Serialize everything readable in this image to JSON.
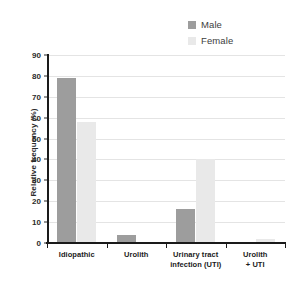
{
  "chart_data": {
    "type": "bar",
    "title": "",
    "subtitle": "",
    "xlabel": "",
    "ylabel": "Relative frequency (%)",
    "categories": [
      "Idiopathic",
      "Urinary tract infection (UTI)",
      "Urolith",
      "Urolith + UTI"
    ],
    "category_lines": [
      [
        "Idiopathic"
      ],
      [
        "Urolith"
      ],
      [
        "Urinary tract",
        "infection (UTI)"
      ],
      [
        "Urolith",
        "+ UTI"
      ]
    ],
    "category_order": [
      "Idiopathic",
      "Urolith",
      "Urinary tract infection (UTI)",
      "Urolith + UTI"
    ],
    "series": [
      {
        "name": "Male",
        "color": "#9d9d9d",
        "values": [
          79,
          16.5,
          4,
          0
        ]
      },
      {
        "name": "Female",
        "color": "#e9e9e9",
        "values": [
          58,
          40,
          0,
          2
        ]
      }
    ],
    "ylim": [
      0,
      90
    ],
    "yticks": [
      0,
      10,
      20,
      30,
      40,
      50,
      60,
      70,
      80,
      90
    ],
    "ytick_labels": [
      "0",
      "10",
      "20",
      "30",
      "40",
      "50",
      "60",
      "70",
      "80",
      "90"
    ],
    "grid": true,
    "grid_axis": "y",
    "legend_position": "top-right",
    "background": "#ffffff"
  },
  "legend": {
    "entries": [
      {
        "label": "Male",
        "swatch": "#9d9d9d"
      },
      {
        "label": "Female",
        "swatch": "#e9e9e9"
      }
    ]
  },
  "axes": {
    "y_title": "Relative frequency (%)"
  }
}
